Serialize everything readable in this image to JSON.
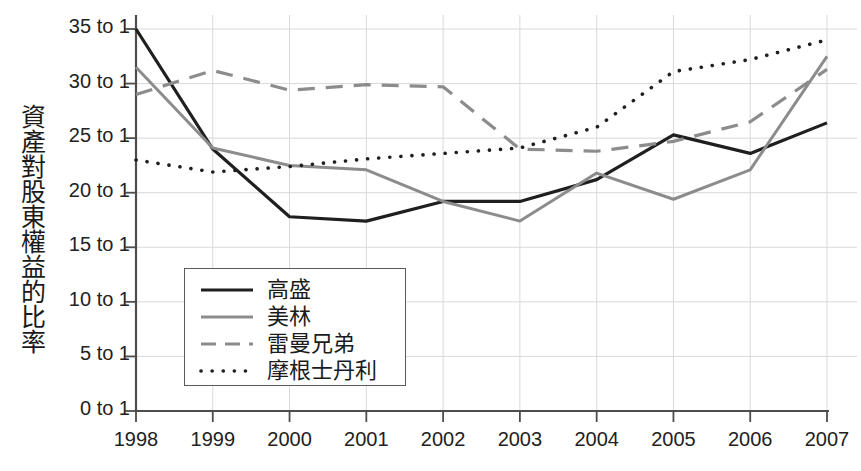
{
  "chart_data": {
    "type": "line",
    "title": "",
    "xlabel": "",
    "ylabel": "資產對股東權益的比率",
    "categories": [
      "1998",
      "1999",
      "2000",
      "2001",
      "2002",
      "2003",
      "2004",
      "2005",
      "2006",
      "2007"
    ],
    "x": [
      1998,
      1999,
      2000,
      2001,
      2002,
      2003,
      2004,
      2005,
      2006,
      2007
    ],
    "ytick_labels": [
      "0 to 1",
      "5 to 1",
      "10 to 1",
      "15 to 1",
      "20 to 1",
      "25 to 1",
      "30 to 1",
      "35 to 1"
    ],
    "ytick_values": [
      0,
      5,
      10,
      15,
      20,
      25,
      30,
      35
    ],
    "ylim": [
      0,
      35
    ],
    "grid": true,
    "legend_position": "inside-lower-left",
    "series": [
      {
        "name": "高盛",
        "style": "solid",
        "color": "#1f1f1f",
        "width": 3.2,
        "values": [
          35.0,
          24.0,
          17.8,
          17.4,
          19.2,
          19.2,
          21.2,
          25.3,
          23.6,
          26.4
        ]
      },
      {
        "name": "美林",
        "style": "solid",
        "color": "#8c8c8c",
        "width": 3.0,
        "values": [
          31.5,
          24.1,
          22.5,
          22.1,
          19.2,
          17.4,
          21.8,
          19.4,
          22.1,
          32.5
        ]
      },
      {
        "name": "雷曼兄弟",
        "style": "dashed",
        "color": "#8c8c8c",
        "width": 3.2,
        "values": [
          29.0,
          31.2,
          29.4,
          29.9,
          29.7,
          24.0,
          23.8,
          24.7,
          26.5,
          31.3
        ]
      },
      {
        "name": "摩根士丹利",
        "style": "dotted",
        "color": "#1f1f1f",
        "width": 3.6,
        "values": [
          23.0,
          21.9,
          22.4,
          23.1,
          23.6,
          24.1,
          26.0,
          31.1,
          32.2,
          34.0
        ]
      }
    ]
  },
  "legend": {
    "items": [
      {
        "label": "高盛"
      },
      {
        "label": "美林"
      },
      {
        "label": "雷曼兄弟"
      },
      {
        "label": "摩根士丹利"
      }
    ]
  },
  "colors": {
    "dark": "#1f1f1f",
    "gray": "#8c8c8c",
    "grid": "#d9d9d9",
    "axis": "#4d4d4d",
    "text": "#222222"
  }
}
